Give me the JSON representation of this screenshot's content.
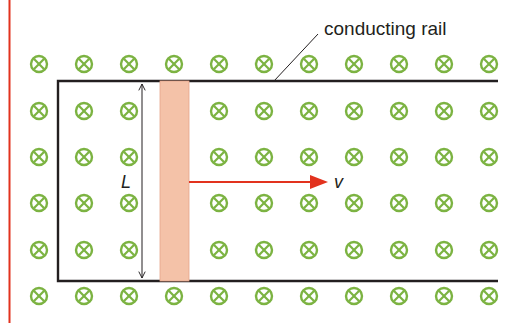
{
  "diagram": {
    "labels": {
      "rail": "conducting rail",
      "length": "L",
      "velocity": "v"
    },
    "field": {
      "symbol": "into-page",
      "icon": "cross-circle-icon",
      "columns_x": [
        39,
        84,
        129,
        174,
        219,
        264,
        309,
        354,
        399,
        444,
        489
      ],
      "rows_y": [
        64,
        111,
        157,
        203,
        250,
        296
      ],
      "hidden_under_bar_rows": [
        1,
        2,
        3,
        4
      ],
      "radius": 8
    },
    "colors": {
      "field_symbol": "#7cb342",
      "rail": "#231f20",
      "bar_fill": "#f4c2a8",
      "bar_edge": "#e6a58a",
      "velocity_arrow": "#e2321e",
      "margin_line": "#e2321e",
      "dimension_line": "#231f20"
    },
    "geometry": {
      "rail_top_y": 81,
      "rail_bottom_y": 281,
      "rail_left_x": 58,
      "rail_right_x": 498,
      "bar_x": 160,
      "bar_width": 29,
      "dim_x": 142,
      "arrow_y": 182,
      "arrow_x1": 189,
      "arrow_x2": 328
    }
  }
}
